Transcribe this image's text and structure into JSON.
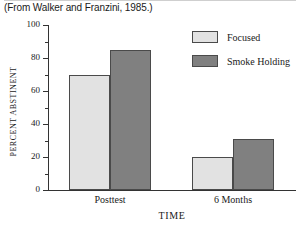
{
  "caption": "(From Walker and Franzini, 1985.)",
  "colors": {
    "focused": "#e2e2e2",
    "smoke_holding": "#808080",
    "bar_border": "#4a4a4a",
    "axis": "#333333",
    "text": "#1a1a1a",
    "background": "#ffffff"
  },
  "legend": {
    "position": "top-right",
    "items": [
      {
        "label": "Focused",
        "color": "#e2e2e2"
      },
      {
        "label": "Smoke Holding",
        "color": "#808080"
      }
    ]
  },
  "chart_data": {
    "type": "bar",
    "title": "",
    "categories": [
      "Posttest",
      "6 Months"
    ],
    "series": [
      {
        "name": "Focused",
        "color": "#e2e2e2",
        "values": [
          70,
          20
        ]
      },
      {
        "name": "Smoke Holding",
        "color": "#808080",
        "values": [
          85,
          31
        ]
      }
    ],
    "xlabel": "TIME",
    "ylabel": "PERCENT ABSTINENT",
    "ylim": [
      0,
      100
    ],
    "ymajor_ticks": [
      0,
      20,
      40,
      60,
      80,
      100
    ],
    "yminor_ticks": [
      10,
      30,
      50,
      70,
      90
    ],
    "ytick_labels": [
      "0",
      "20",
      "40",
      "60",
      "80",
      "100"
    ],
    "grid": false,
    "legend_position": "top-right"
  }
}
